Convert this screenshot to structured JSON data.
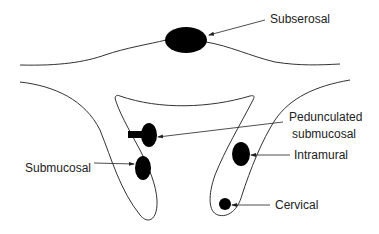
{
  "diagram": {
    "type": "anatomical-schematic",
    "labels": {
      "subserosal": "Subserosal",
      "pedunculated_line1": "Pedunculated",
      "pedunculated_line2": "submucosal",
      "submucosal": "Submucosal",
      "intramural": "Intramural",
      "cervical": "Cervical"
    },
    "colors": {
      "stroke": "#333333",
      "lesion": "#000000",
      "text": "#222222",
      "background": "#ffffff"
    }
  }
}
